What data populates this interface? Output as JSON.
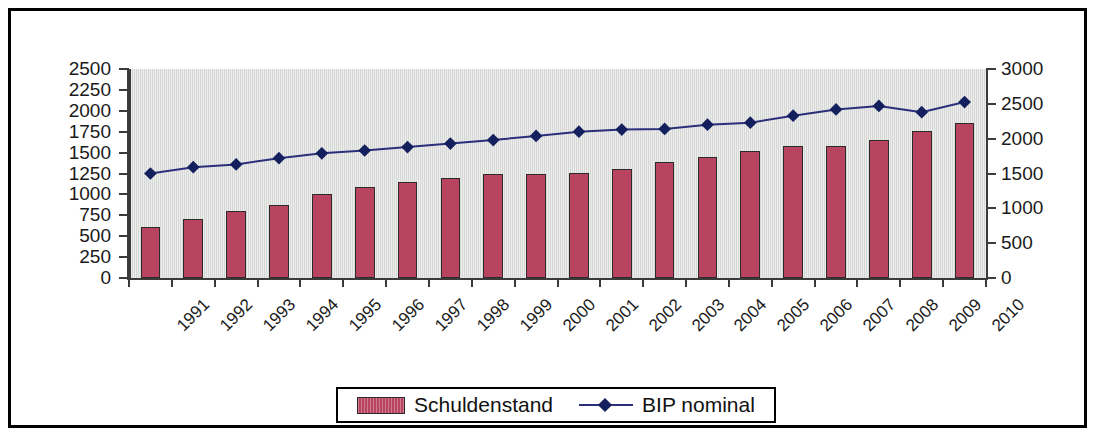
{
  "chart_data": {
    "type": "bar",
    "title": "",
    "subtitle": "",
    "xlabel": "",
    "ylabel": "",
    "grid": false,
    "legend_position": "bottom",
    "categories": [
      "1991",
      "1992",
      "1993",
      "1994",
      "1995",
      "1996",
      "1997",
      "1998",
      "1999",
      "2000",
      "2001",
      "2002",
      "2003",
      "2004",
      "2005",
      "2006",
      "2007",
      "2008",
      "2009",
      "2010"
    ],
    "axes": {
      "left": {
        "min": 0,
        "max": 2500,
        "step": 250,
        "ticks": [
          "0",
          "250",
          "500",
          "750",
          "1000",
          "1250",
          "1500",
          "1750",
          "2000",
          "2250",
          "2500"
        ]
      },
      "right": {
        "min": 0,
        "max": 3000,
        "step": 500,
        "ticks": [
          "0",
          "500",
          "1000",
          "1500",
          "2000",
          "2500",
          "3000"
        ]
      }
    },
    "series": [
      {
        "name": "Schuldenstand",
        "type": "bar",
        "axis": "left",
        "color": "#b8445f",
        "border_color": "#2b2b2b",
        "values": [
          610,
          700,
          800,
          870,
          1010,
          1090,
          1150,
          1200,
          1250,
          1250,
          1260,
          1300,
          1390,
          1450,
          1520,
          1580,
          1580,
          1650,
          1760,
          1850
        ]
      },
      {
        "name": "BIP nominal",
        "type": "line",
        "axis": "right",
        "color": "#2b2f7a",
        "marker": "diamond",
        "marker_color": "#14205e",
        "values": [
          1500,
          1590,
          1630,
          1720,
          1790,
          1830,
          1880,
          1930,
          1980,
          2040,
          2100,
          2130,
          2140,
          2200,
          2230,
          2330,
          2420,
          2470,
          2380,
          2525
        ]
      }
    ]
  },
  "legend": {
    "items": [
      {
        "label": "Schuldenstand",
        "marker": "bar-swatch"
      },
      {
        "label": "BIP nominal",
        "marker": "line-diamond"
      }
    ]
  }
}
